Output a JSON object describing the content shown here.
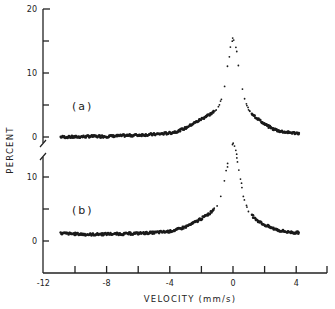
{
  "chart_data": {
    "type": "scatter",
    "title": "",
    "xlabel": "VELOCITY (mm/s)",
    "ylabel": "PERCENT",
    "xlim": [
      -12,
      6
    ],
    "x_ticks": [
      -12,
      -8,
      -4,
      0,
      4
    ],
    "x_minor_ticks": [
      -10,
      -6,
      -2,
      2,
      6
    ],
    "grid": false,
    "legend": null,
    "panels": [
      {
        "label": "(a)",
        "ylim": [
          0,
          20
        ],
        "y_ticks": [
          0,
          10,
          20
        ],
        "y_minor_ticks": [
          5,
          15
        ],
        "series": [
          {
            "name": "(a)",
            "x": [
              -10.9,
              -10,
              -9,
              -8,
              -7,
              -6,
              -5,
              -4,
              -3.5,
              -3,
              -2.5,
              -2,
              -1.5,
              -1,
              -0.7,
              -0.5,
              -0.3,
              -0.15,
              0,
              0.15,
              0.3,
              0.5,
              0.7,
              1,
              1.5,
              2,
              2.5,
              3,
              3.5,
              4,
              4.2
            ],
            "y": [
              0.0,
              0.0,
              0.1,
              0.1,
              0.2,
              0.3,
              0.4,
              0.6,
              0.9,
              1.4,
              2.1,
              2.8,
              3.5,
              4.3,
              6.0,
              8.5,
              11.5,
              14.0,
              15.5,
              14.3,
              12.0,
              8.5,
              6.0,
              4.2,
              3.0,
              2.0,
              1.3,
              0.9,
              0.7,
              0.6,
              0.6
            ]
          }
        ]
      },
      {
        "label": "(b)",
        "ylim": [
          -4,
          13
        ],
        "y_ticks": [
          0,
          10
        ],
        "y_minor_ticks": [
          5
        ],
        "series": [
          {
            "name": "(b)",
            "x": [
              -10.9,
              -10,
              -9,
              -8,
              -7,
              -6,
              -5,
              -4,
              -3.5,
              -3,
              -2.5,
              -2,
              -1.5,
              -1,
              -0.7,
              -0.5,
              -0.3,
              -0.15,
              0,
              0.15,
              0.3,
              0.5,
              0.7,
              1,
              1.5,
              2,
              2.5,
              3,
              3.5,
              4,
              4.2
            ],
            "y": [
              1.2,
              1.1,
              1.0,
              1.1,
              1.1,
              1.2,
              1.3,
              1.5,
              1.8,
              2.2,
              2.8,
              3.5,
              4.3,
              5.5,
              7.5,
              10.0,
              12.5,
              14.5,
              15.3,
              14.5,
              12.5,
              9.5,
              6.5,
              4.5,
              3.3,
              2.5,
              2.0,
              1.6,
              1.4,
              1.3,
              1.3
            ]
          }
        ]
      }
    ],
    "annotations": [
      "axis break between panels on y-axis"
    ]
  },
  "labels": {
    "ylabel": "PERCENT",
    "xlabel": "VELOCITY (mm/s)",
    "panel_a": "(a)",
    "panel_b": "(b)",
    "x_tick_labels": [
      "-12",
      "-8",
      "-4",
      "0",
      "4"
    ],
    "y_a_tick_labels": [
      "0",
      "10",
      "20"
    ],
    "y_b_tick_labels": [
      "0",
      "10"
    ]
  }
}
